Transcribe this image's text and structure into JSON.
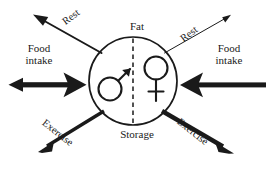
{
  "diagram": {
    "canvas": {
      "width": 266,
      "height": 169,
      "background": "#ffffff"
    },
    "stroke_color": "#1a1a1a",
    "center": {
      "label_top": "Fat",
      "label_bottom": "Storage",
      "circle": {
        "cx": 133,
        "cy": 81,
        "rx": 44,
        "ry": 44,
        "stroke_width": 1.6
      },
      "divider": {
        "style": "dashed",
        "orientation": "vertical"
      },
      "symbols": [
        {
          "name": "male-symbol",
          "glyph": "♂",
          "side": "left"
        },
        {
          "name": "female-symbol",
          "glyph": "♀",
          "side": "right"
        }
      ]
    },
    "flows": [
      {
        "id": "food-intake-left",
        "label": "Food intake",
        "label_lines": [
          "Food",
          "intake"
        ],
        "direction": "horizontal",
        "side": "left",
        "arrowheads": "double",
        "weight": "thick"
      },
      {
        "id": "food-intake-right",
        "label": "Food intake",
        "label_lines": [
          "Food",
          "intake"
        ],
        "direction": "horizontal",
        "side": "right",
        "arrowheads": "single-inward",
        "weight": "thick"
      },
      {
        "id": "rest-left",
        "label": "Rest",
        "direction": "diagonal-up-left",
        "side": "left",
        "arrowheads": "single-outward",
        "weight": "medium"
      },
      {
        "id": "rest-right",
        "label": "Rest",
        "direction": "diagonal-up-right",
        "side": "right",
        "arrowheads": "single-outward",
        "weight": "thin"
      },
      {
        "id": "exercise-left",
        "label": "Exercise",
        "direction": "diagonal-down-left",
        "side": "left",
        "arrowheads": "single-outward",
        "weight": "thick"
      },
      {
        "id": "exercise-right",
        "label": "Exercise",
        "direction": "diagonal-down-right",
        "side": "right",
        "arrowheads": "single-outward",
        "weight": "extra-thick"
      }
    ]
  }
}
